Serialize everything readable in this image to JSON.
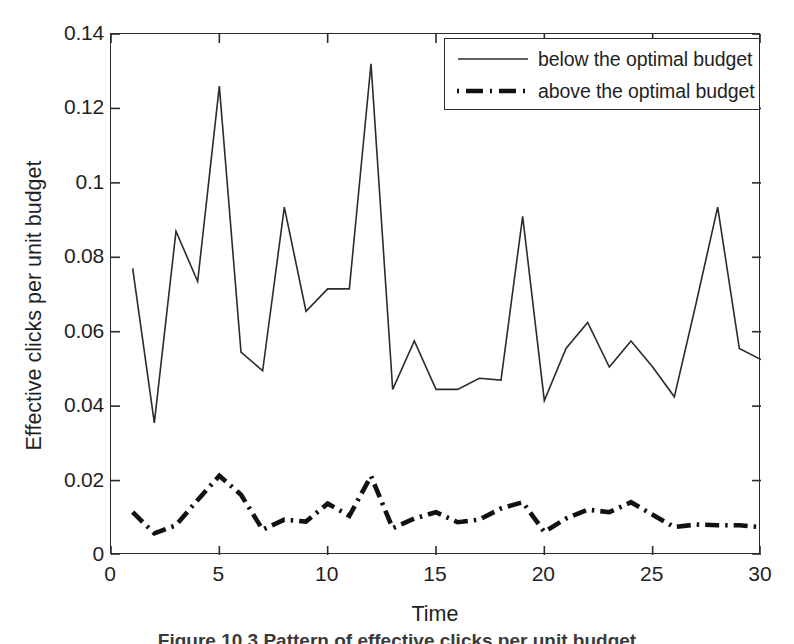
{
  "chart_data": {
    "type": "line",
    "title": "",
    "xlabel": "Time",
    "ylabel": "Effective clicks per unit budget",
    "xlim": [
      0,
      30
    ],
    "ylim": [
      0,
      0.14
    ],
    "grid": false,
    "legend_position": "top-right-inside",
    "x_ticks": [
      "0",
      "5",
      "10",
      "15",
      "20",
      "25",
      "30"
    ],
    "x_tick_values": [
      0,
      5,
      10,
      15,
      20,
      25,
      30
    ],
    "y_ticks": [
      "0",
      "0.02",
      "0.04",
      "0.06",
      "0.08",
      "0.1",
      "0.12",
      "0.14"
    ],
    "y_tick_values": [
      0,
      0.02,
      0.04,
      0.06,
      0.08,
      0.1,
      0.12,
      0.14
    ],
    "x": [
      1,
      2,
      3,
      4,
      5,
      6,
      7,
      8,
      9,
      10,
      11,
      12,
      13,
      14,
      15,
      16,
      17,
      18,
      19,
      20,
      21,
      22,
      23,
      24,
      25,
      26,
      27,
      28,
      29,
      30
    ],
    "series": [
      {
        "name": "below the optimal budget",
        "style": "solid",
        "color": "#2b2b2b",
        "width": 1.6,
        "values": [
          0.077,
          0.0355,
          0.087,
          0.0735,
          0.126,
          0.0545,
          0.0495,
          0.0935,
          0.0655,
          0.0715,
          0.0715,
          0.132,
          0.0445,
          0.0575,
          0.0445,
          0.0445,
          0.0475,
          0.047,
          0.091,
          0.0415,
          0.0555,
          0.0625,
          0.0505,
          0.0575,
          0.0505,
          0.0425,
          0.0675,
          0.0935,
          0.0555,
          0.0525
        ]
      },
      {
        "name": "above the optimal budget",
        "style": "dashdot",
        "color": "#111111",
        "width": 4.6,
        "values": [
          0.0115,
          0.0058,
          0.008,
          0.0148,
          0.0213,
          0.0162,
          0.0068,
          0.0095,
          0.009,
          0.0138,
          0.0105,
          0.0212,
          0.0072,
          0.0098,
          0.0115,
          0.0088,
          0.0095,
          0.0125,
          0.0142,
          0.0062,
          0.0098,
          0.0122,
          0.0115,
          0.0142,
          0.0108,
          0.0075,
          0.0082,
          0.008,
          0.008,
          0.0075
        ]
      }
    ]
  },
  "legend": {
    "entries": [
      {
        "label": "below the optimal budget",
        "sample": "solid-line-sample"
      },
      {
        "label": "above the optimal budget",
        "sample": "dashdot-line-sample"
      }
    ]
  },
  "caption": {
    "text": "Figure 10.3   Pattern of effective clicks per unit budget"
  }
}
